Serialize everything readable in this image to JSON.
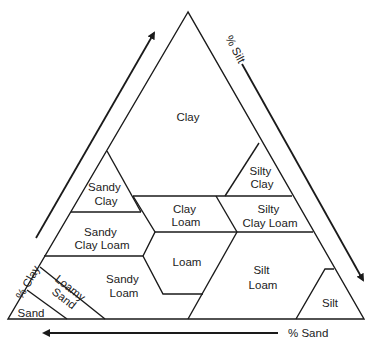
{
  "diagram": {
    "type": "soil-texture-triangle",
    "axes": {
      "clay": "% Clay",
      "silt": "% Silt",
      "sand": "% Sand"
    },
    "regions": [
      {
        "id": "clay",
        "lines": [
          "Clay"
        ]
      },
      {
        "id": "silty-clay",
        "lines": [
          "Silty",
          "Clay"
        ]
      },
      {
        "id": "sandy-clay",
        "lines": [
          "Sandy",
          "Clay"
        ]
      },
      {
        "id": "clay-loam",
        "lines": [
          "Clay",
          "Loam"
        ]
      },
      {
        "id": "silty-clay-loam",
        "lines": [
          "Silty",
          "Clay Loam"
        ]
      },
      {
        "id": "sandy-clay-loam",
        "lines": [
          "Sandy",
          "Clay Loam"
        ]
      },
      {
        "id": "loam",
        "lines": [
          "Loam"
        ]
      },
      {
        "id": "silt-loam",
        "lines": [
          "Silt",
          "Loam"
        ]
      },
      {
        "id": "sandy-loam",
        "lines": [
          "Sandy",
          "Loam"
        ]
      },
      {
        "id": "loamy-sand",
        "lines": [
          "Loamy",
          "Sand"
        ]
      },
      {
        "id": "sand",
        "lines": [
          "Sand"
        ]
      },
      {
        "id": "silt",
        "lines": [
          "Silt"
        ]
      }
    ],
    "colors": {
      "line": "#1a1a1a",
      "text": "#222222",
      "background": "#ffffff"
    }
  }
}
